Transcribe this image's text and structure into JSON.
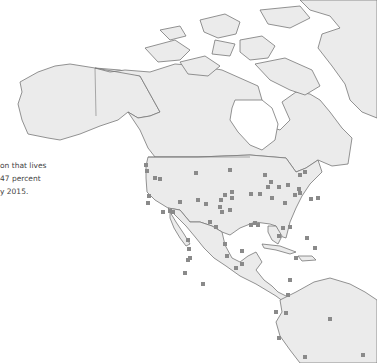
{
  "caption": {
    "lines": [
      "on that lives",
      "47 percent",
      "y 2015."
    ]
  },
  "colors": {
    "land": "#ebebeb",
    "coast": "#777777",
    "marker": "#8a8a8a",
    "text": "#444444",
    "background": "#ffffff"
  },
  "map": {
    "region": "North, Central and northern South America",
    "marker_shape": "square",
    "markers": [
      [
        146,
        165
      ],
      [
        147,
        171
      ],
      [
        149,
        196
      ],
      [
        148,
        203
      ],
      [
        163,
        212
      ],
      [
        173,
        212
      ],
      [
        196,
        173
      ],
      [
        230,
        170
      ],
      [
        232,
        192
      ],
      [
        251,
        194
      ],
      [
        260,
        194
      ],
      [
        272,
        198
      ],
      [
        271,
        182
      ],
      [
        268,
        187
      ],
      [
        265,
        175
      ],
      [
        279,
        187
      ],
      [
        288,
        185
      ],
      [
        295,
        195
      ],
      [
        299,
        189
      ],
      [
        300,
        193
      ],
      [
        285,
        203
      ],
      [
        283,
        228
      ],
      [
        255,
        223
      ],
      [
        222,
        212
      ],
      [
        210,
        222
      ],
      [
        225,
        244
      ],
      [
        242,
        251
      ],
      [
        227,
        256
      ],
      [
        188,
        240
      ],
      [
        216,
        227
      ],
      [
        251,
        225
      ],
      [
        258,
        225
      ],
      [
        242,
        264
      ],
      [
        236,
        268
      ],
      [
        290,
        227
      ],
      [
        279,
        236
      ],
      [
        307,
        238
      ],
      [
        315,
        248
      ],
      [
        296,
        258
      ],
      [
        290,
        280
      ],
      [
        288,
        295
      ],
      [
        276,
        312
      ],
      [
        286,
        313
      ],
      [
        279,
        338
      ],
      [
        305,
        357
      ],
      [
        330,
        319
      ],
      [
        363,
        355
      ],
      [
        185,
        273
      ],
      [
        203,
        284
      ],
      [
        189,
        249
      ],
      [
        190,
        258
      ],
      [
        188,
        260
      ],
      [
        206,
        204
      ],
      [
        198,
        200
      ],
      [
        220,
        207
      ],
      [
        221,
        200
      ],
      [
        232,
        198
      ],
      [
        230,
        210
      ],
      [
        155,
        178
      ],
      [
        160,
        179
      ],
      [
        180,
        202
      ],
      [
        170,
        211
      ],
      [
        300,
        175
      ],
      [
        305,
        172
      ],
      [
        311,
        199
      ],
      [
        318,
        198
      ],
      [
        225,
        195
      ]
    ]
  }
}
